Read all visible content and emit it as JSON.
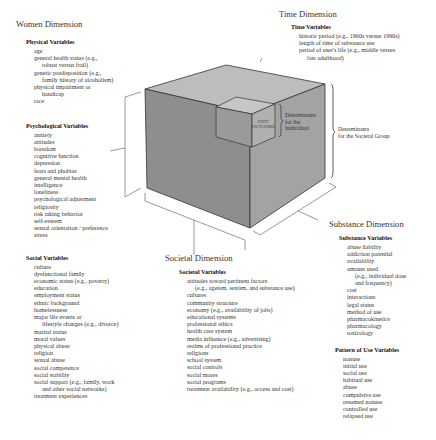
{
  "women": {
    "dimension_title": "Women Dimension",
    "groups": [
      {
        "title": "Physical Variables",
        "items": [
          {
            "text": "age"
          },
          {
            "text": "general health status (e.g.,",
            "cont": "robust versus frail)"
          },
          {
            "text": "genetic predisposition (e.g.,",
            "cont": "family history of alcoholism)"
          },
          {
            "text": "physical impairment or",
            "cont": "handicap"
          },
          {
            "text": "race"
          }
        ]
      },
      {
        "title": "Psychological Variables",
        "items": [
          {
            "text": "anxiety"
          },
          {
            "text": "attitudes"
          },
          {
            "text": "boredom"
          },
          {
            "text": "cognitive function"
          },
          {
            "text": "depression"
          },
          {
            "text": "fears and phobias"
          },
          {
            "text": "general mental health"
          },
          {
            "text": "intelligence"
          },
          {
            "text": "loneliness"
          },
          {
            "text": "psychological adjustment"
          },
          {
            "text": "religiosity"
          },
          {
            "text": "risk taking behavior"
          },
          {
            "text": "self-esteem"
          },
          {
            "text": "sexual orientation / preference"
          },
          {
            "text": "stress"
          }
        ]
      },
      {
        "title": "Social Variables",
        "items": [
          {
            "text": "culture"
          },
          {
            "text": "dysfunctional family"
          },
          {
            "text": "economic status (e.g., poverty)"
          },
          {
            "text": "education"
          },
          {
            "text": "employment status"
          },
          {
            "text": "ethnic background"
          },
          {
            "text": "homelessness"
          },
          {
            "text": "major life events or",
            "cont": "lifestyle changes (e.g., divorce)"
          },
          {
            "text": "marital status"
          },
          {
            "text": "moral values"
          },
          {
            "text": "physical abuse"
          },
          {
            "text": "religion"
          },
          {
            "text": "sexual abuse"
          },
          {
            "text": "social competence"
          },
          {
            "text": "social stability"
          },
          {
            "text": "social support (e.g., family, work",
            "cont": "and other social networks)"
          },
          {
            "text": "treatment experiences"
          }
        ]
      }
    ]
  },
  "time": {
    "dimension_title": "Time Dimension",
    "groups": [
      {
        "title": "Time Variables",
        "items": [
          {
            "text": "historic period (e.g., 1960s versus 1990s)"
          },
          {
            "text": "length of time of substance use"
          },
          {
            "text": "period of user's life (e.g., middle verses",
            "cont": "late adulthood)"
          }
        ]
      }
    ]
  },
  "substance": {
    "dimension_title": "Substance Dimension",
    "groups": [
      {
        "title": "Substance Variables",
        "items": [
          {
            "text": "abuse liability"
          },
          {
            "text": "addiction potential"
          },
          {
            "text": "availability"
          },
          {
            "text": "amount used"
          },
          {
            "text": "(e.g., individual dose",
            "indent": true
          },
          {
            "text": "and frequency)",
            "indent": true
          },
          {
            "text": "cost"
          },
          {
            "text": "interactions"
          },
          {
            "text": "legal status"
          },
          {
            "text": "method of use"
          },
          {
            "text": "pharmacokinetics"
          },
          {
            "text": "pharmacology"
          },
          {
            "text": "toxicology"
          }
        ]
      },
      {
        "title": "Pattern of Use Variables",
        "items": [
          {
            "text": "nonuse"
          },
          {
            "text": "initial use"
          },
          {
            "text": "social use"
          },
          {
            "text": "habitual use"
          },
          {
            "text": "abuse"
          },
          {
            "text": "compulsive use"
          },
          {
            "text": "resumed nonuse"
          },
          {
            "text": "controlled use"
          },
          {
            "text": "relapsed use"
          }
        ]
      }
    ]
  },
  "societal": {
    "dimension_title": "Societal Dimension",
    "groups": [
      {
        "title": "Societal Variables",
        "items": [
          {
            "text": "attitudes toward pertinent factors",
            "cont": "(e.g., ageism, sexism, and substance use)"
          },
          {
            "text": "cultures"
          },
          {
            "text": "community structure"
          },
          {
            "text": "economy (e.g., availability of jobs)"
          },
          {
            "text": "educational systems"
          },
          {
            "text": "professional ethics"
          },
          {
            "text": "health care system"
          },
          {
            "text": "media influence (e.g., advertising)"
          },
          {
            "text": "realms of professional practice"
          },
          {
            "text": "religions"
          },
          {
            "text": "school system"
          },
          {
            "text": "social controls"
          },
          {
            "text": "social mores"
          },
          {
            "text": "social programs"
          },
          {
            "text": "treatment availability (e.g., access and cost)"
          }
        ]
      }
    ]
  },
  "cube": {
    "unit_label_line1": "UNIT",
    "unit_label_line2": "OUTCOME",
    "individual_label": [
      "Determinants",
      "for the",
      "Individual"
    ],
    "societal_label": [
      "Determinants",
      "for the Societal Group"
    ],
    "colors": {
      "top_face": "#b8b8b8",
      "left_face": "#8f8f8f",
      "right_face": "#a2a2a2",
      "edge": "#333333"
    }
  }
}
